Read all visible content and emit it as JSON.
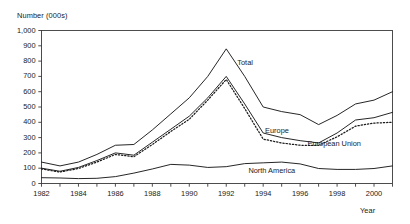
{
  "chart_data": {
    "type": "line",
    "title": "",
    "ylabel": "Number (000s)",
    "xlabel": "Year",
    "ylim": [
      0,
      1000
    ],
    "ytick_step": 100,
    "yticks": [
      "0",
      "100",
      "200",
      "300",
      "400",
      "500",
      "600",
      "700",
      "800",
      "900",
      "1,000"
    ],
    "ytick_values": [
      0,
      100,
      200,
      300,
      400,
      500,
      600,
      700,
      800,
      900,
      1000
    ],
    "xlim": [
      1982,
      2001
    ],
    "xticks": [
      "1982",
      "1984",
      "1986",
      "1988",
      "1990",
      "1992",
      "1994",
      "1996",
      "1998",
      "2000"
    ],
    "xtick_values": [
      1982,
      1984,
      1986,
      1988,
      1990,
      1992,
      1994,
      1996,
      1998,
      2000
    ],
    "x": [
      1982,
      1983,
      1984,
      1985,
      1986,
      1987,
      1988,
      1989,
      1990,
      1991,
      1992,
      1993,
      1994,
      1995,
      1996,
      1997,
      1998,
      1999,
      2000,
      2001
    ],
    "grid": false,
    "legend_position": "inline-annotations",
    "series": [
      {
        "name": "Total",
        "style": "solid",
        "color": "#1a1a1a",
        "label_x": 1992.6,
        "label_y": 790,
        "values": [
          140,
          115,
          140,
          190,
          250,
          255,
          350,
          455,
          560,
          700,
          880,
          700,
          500,
          470,
          450,
          385,
          445,
          520,
          545,
          600
        ]
      },
      {
        "name": "Europe",
        "style": "solid",
        "color": "#1a1a1a",
        "label_x": 1994.1,
        "label_y": 345,
        "values": [
          100,
          80,
          105,
          150,
          200,
          185,
          270,
          355,
          440,
          560,
          700,
          520,
          330,
          300,
          280,
          265,
          330,
          415,
          430,
          465
        ]
      },
      {
        "name": "European Union",
        "style": "dotted",
        "color": "#1a1a1a",
        "label_x": 1996.4,
        "label_y": 255,
        "values": [
          95,
          75,
          98,
          140,
          190,
          175,
          255,
          340,
          420,
          545,
          680,
          490,
          290,
          265,
          250,
          250,
          305,
          375,
          395,
          400
        ]
      },
      {
        "name": "North America",
        "style": "solid",
        "color": "#1a1a1a",
        "label_x": 1993.2,
        "label_y": 80,
        "values": [
          38,
          36,
          32,
          34,
          45,
          68,
          95,
          125,
          120,
          105,
          110,
          130,
          135,
          140,
          128,
          98,
          92,
          92,
          98,
          115
        ]
      }
    ]
  }
}
